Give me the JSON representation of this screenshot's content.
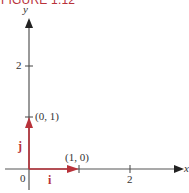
{
  "figure": {
    "title": "FIGURE 1.12",
    "x_axis_label": "x",
    "y_axis_label": "y",
    "origin_label": "0",
    "x_ticks": [
      "2"
    ],
    "y_ticks": [
      "2"
    ],
    "points": [
      {
        "label": "(0, 1)"
      },
      {
        "label": "(1, 0)"
      }
    ],
    "vectors": [
      {
        "name": "i",
        "from": [
          0,
          0
        ],
        "to": [
          1,
          0
        ]
      },
      {
        "name": "j",
        "from": [
          0,
          0
        ],
        "to": [
          0,
          1
        ]
      }
    ],
    "colors": {
      "vector": "#b8323a",
      "axis": "#555555",
      "title": "#b8323a"
    }
  }
}
